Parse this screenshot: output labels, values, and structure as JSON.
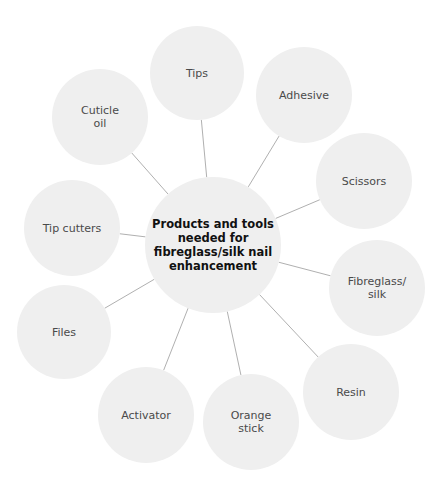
{
  "diagram": {
    "type": "spider-map",
    "colors": {
      "node_fill": "#efefef",
      "line": "#b0b0b0",
      "text": "#4a4a4a",
      "center_text": "#111111"
    },
    "center": {
      "label": "Products and tools\nneeded for\nfibreglass/silk nail\nenhancement",
      "cx": 213,
      "cy": 245,
      "r": 68
    },
    "nodes": [
      {
        "id": "tips",
        "label": "Tips",
        "cx": 197,
        "cy": 73,
        "r": 47
      },
      {
        "id": "adhesive",
        "label": "Adhesive",
        "cx": 304,
        "cy": 95,
        "r": 48
      },
      {
        "id": "scissors",
        "label": "Scissors",
        "cx": 364,
        "cy": 181,
        "r": 48
      },
      {
        "id": "fibreglass-silk",
        "label": "Fibreglass/\nsilk",
        "cx": 377,
        "cy": 288,
        "r": 48
      },
      {
        "id": "resin",
        "label": "Resin",
        "cx": 351,
        "cy": 392,
        "r": 48
      },
      {
        "id": "orange-stick",
        "label": "Orange\nstick",
        "cx": 251,
        "cy": 422,
        "r": 48
      },
      {
        "id": "activator",
        "label": "Activator",
        "cx": 146,
        "cy": 415,
        "r": 48
      },
      {
        "id": "files",
        "label": "Files",
        "cx": 64,
        "cy": 332,
        "r": 47
      },
      {
        "id": "tip-cutters",
        "label": "Tip cutters",
        "cx": 72,
        "cy": 228,
        "r": 48
      },
      {
        "id": "cuticle-oil",
        "label": "Cuticle\noil",
        "cx": 100,
        "cy": 117,
        "r": 48
      }
    ]
  }
}
